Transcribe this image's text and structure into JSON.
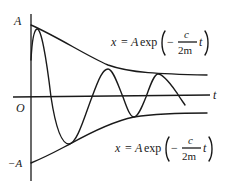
{
  "diagram": {
    "axes": {
      "vertical_top_label": "A",
      "origin_label": "O",
      "vertical_bottom_label": "−A",
      "horizontal_label": "t"
    },
    "upper_envelope": {
      "lhs": "x",
      "eq_sign": "=",
      "coef": "A",
      "func": "exp",
      "neg": "−",
      "num": "c",
      "den": "2m",
      "var": "t"
    },
    "lower_envelope": {
      "lhs": "x",
      "eq_sign": "=",
      "coef": "A",
      "func": "exp",
      "neg": "−",
      "num": "c",
      "den": "2m",
      "var": "t"
    },
    "colors": {
      "ink": "#1a1a1a",
      "background": "#ffffff"
    }
  }
}
